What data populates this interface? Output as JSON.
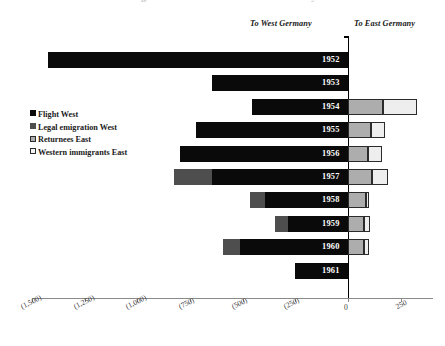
{
  "title": "Migration between East and West Germany",
  "headers": {
    "west": "To West Germany",
    "east": "To East Germany"
  },
  "legend": {
    "items": [
      {
        "label": "Flight West",
        "key": "flight",
        "color": "#0a0a0a"
      },
      {
        "label": "Legal emigration West",
        "key": "legal",
        "color": "#4e4e4e"
      },
      {
        "label": "Returnees East",
        "key": "returnees",
        "color": "#adadad"
      },
      {
        "label": "Western immigrants East",
        "key": "western",
        "color": "#eeeeee"
      }
    ]
  },
  "axis": {
    "tick_labels": [
      "(1,500)",
      "(1,250)",
      "(1,000)",
      "(750)",
      "(500)",
      "(250)",
      "0",
      "250"
    ],
    "tick_values": [
      -1500,
      -1250,
      -1000,
      -750,
      -500,
      -250,
      0,
      250
    ],
    "min": -1500,
    "max": 280
  },
  "chart_data": {
    "type": "bar",
    "orientation": "horizontal",
    "stacked": true,
    "title": "Migration between East and West Germany",
    "xlabel": "",
    "ylabel": "",
    "xlim": [
      -1500,
      280
    ],
    "grid": false,
    "legend_position": "left",
    "annotations": [
      "To West Germany",
      "To East Germany"
    ],
    "categories": [
      "1952",
      "1953",
      "1954",
      "1955",
      "1956",
      "1957",
      "1958",
      "1959",
      "1960",
      "1961"
    ],
    "series": [
      {
        "name": "Flight West",
        "values": [
          -1425,
          -645,
          -455,
          -720,
          -795,
          -645,
          -395,
          -285,
          -510,
          -250
        ]
      },
      {
        "name": "Legal emigration West",
        "values": [
          0,
          0,
          0,
          0,
          0,
          -180,
          -70,
          -60,
          -85,
          0
        ]
      },
      {
        "name": "Returnees East",
        "values": [
          0,
          0,
          165,
          110,
          95,
          115,
          85,
          75,
          75,
          0
        ]
      },
      {
        "name": "Western immigrants East",
        "values": [
          0,
          0,
          160,
          65,
          65,
          75,
          15,
          30,
          25,
          0
        ]
      }
    ]
  },
  "rows": [
    {
      "year": "1952",
      "flight": -1425,
      "legal": 0,
      "returnees": 0,
      "western": 0
    },
    {
      "year": "1953",
      "flight": -645,
      "legal": 0,
      "returnees": 0,
      "western": 0
    },
    {
      "year": "1954",
      "flight": -455,
      "legal": 0,
      "returnees": 165,
      "western": 160
    },
    {
      "year": "1955",
      "flight": -720,
      "legal": 0,
      "returnees": 110,
      "western": 65
    },
    {
      "year": "1956",
      "flight": -795,
      "legal": 0,
      "returnees": 95,
      "western": 65
    },
    {
      "year": "1957",
      "flight": -645,
      "legal": -180,
      "returnees": 115,
      "western": 75
    },
    {
      "year": "1958",
      "flight": -395,
      "legal": -70,
      "returnees": 85,
      "western": 15
    },
    {
      "year": "1959",
      "flight": -285,
      "legal": -60,
      "returnees": 75,
      "western": 30
    },
    {
      "year": "1960",
      "flight": -510,
      "legal": -85,
      "returnees": 75,
      "western": 25
    },
    {
      "year": "1961",
      "flight": -250,
      "legal": 0,
      "returnees": 0,
      "western": 0
    }
  ]
}
